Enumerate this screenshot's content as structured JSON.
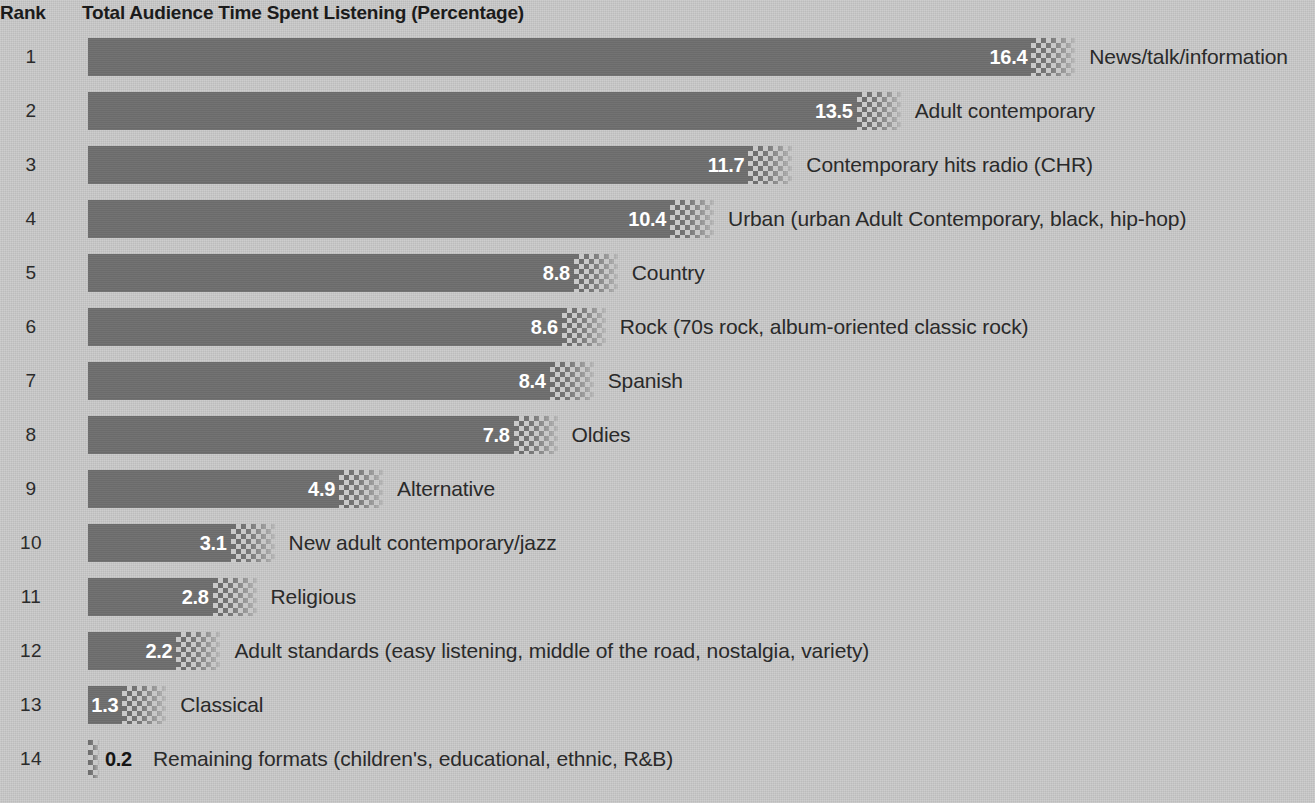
{
  "header": {
    "rank_label": "Rank",
    "title": "Total Audience Time Spent Listening (Percentage)"
  },
  "chart_data": {
    "type": "bar",
    "orientation": "horizontal",
    "title": "Total Audience Time Spent Listening (Percentage)",
    "xlabel": "",
    "ylabel": "",
    "rank_column_header": "Rank",
    "grid": false,
    "legend": null,
    "xlim": [
      0,
      16.4
    ],
    "categories": [
      "News/talk/information",
      "Adult contemporary",
      "Contemporary hits radio (CHR)",
      "Urban (urban Adult Contemporary, black, hip-hop)",
      "Country",
      "Rock (70s rock, album-oriented classic rock)",
      "Spanish",
      "Oldies",
      "Alternative",
      "New adult contemporary/jazz",
      "Religious",
      "Adult standards (easy listening, middle of the road, nostalgia, variety)",
      "Classical",
      "Remaining formats (children's, educational, ethnic, R&B)"
    ],
    "values": [
      16.4,
      13.5,
      11.7,
      10.4,
      8.8,
      8.6,
      8.4,
      7.8,
      4.9,
      3.1,
      2.8,
      2.2,
      1.3,
      0.2
    ],
    "ranks": [
      1,
      2,
      3,
      4,
      5,
      6,
      7,
      8,
      9,
      10,
      11,
      12,
      13,
      14
    ]
  },
  "rows": [
    {
      "rank": "1",
      "value": "16.4",
      "label": "News/talk/information",
      "inside": true
    },
    {
      "rank": "2",
      "value": "13.5",
      "label": "Adult contemporary",
      "inside": true
    },
    {
      "rank": "3",
      "value": "11.7",
      "label": "Contemporary hits radio (CHR)",
      "inside": true
    },
    {
      "rank": "4",
      "value": "10.4",
      "label": "Urban (urban Adult Contemporary, black, hip-hop)",
      "inside": true
    },
    {
      "rank": "5",
      "value": "8.8",
      "label": "Country",
      "inside": true
    },
    {
      "rank": "6",
      "value": "8.6",
      "label": "Rock (70s rock, album-oriented classic rock)",
      "inside": true
    },
    {
      "rank": "7",
      "value": "8.4",
      "label": "Spanish",
      "inside": true
    },
    {
      "rank": "8",
      "value": "7.8",
      "label": "Oldies",
      "inside": true
    },
    {
      "rank": "9",
      "value": "4.9",
      "label": "Alternative",
      "inside": true
    },
    {
      "rank": "10",
      "value": "3.1",
      "label": "New adult contemporary/jazz",
      "inside": true
    },
    {
      "rank": "11",
      "value": "2.8",
      "label": "Religious",
      "inside": true
    },
    {
      "rank": "12",
      "value": "2.2",
      "label": "Adult standards (easy listening, middle of the road, nostalgia, variety)",
      "inside": true
    },
    {
      "rank": "13",
      "value": "1.3",
      "label": "Classical",
      "inside": true
    },
    {
      "rank": "14",
      "value": "0.2",
      "label": "Remaining formats (children's, educational, ethnic, R&B)",
      "inside": false
    }
  ],
  "style": {
    "bar_color": "#6e6e6e",
    "background_color": "#c9c9c9",
    "text_color": "#2a2a2a",
    "value_text_inside_color": "#ffffff",
    "value_text_outside_color": "#151515"
  }
}
